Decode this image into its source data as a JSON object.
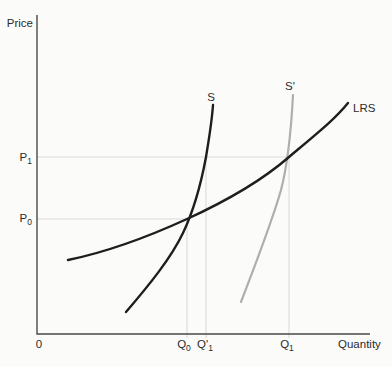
{
  "figure": {
    "axis": {
      "y_label": "Price",
      "x_label": "Quantity",
      "origin": "0"
    },
    "labels": {
      "p1": {
        "base": "P",
        "sub": "1"
      },
      "p0": {
        "base": "P",
        "sub": "0"
      },
      "q0": {
        "base": "Q",
        "sub": "0"
      },
      "q1_prime": {
        "base": "Q",
        "prime": "'",
        "sub": "1"
      },
      "q1": {
        "base": "Q",
        "sub": "1"
      },
      "s": {
        "base": "S"
      },
      "s_prime": {
        "base": "S",
        "prime": "'"
      },
      "lrs": {
        "base": "LRS"
      }
    },
    "colors": {
      "black_curve": "#1e1e1e",
      "gray_curve": "#aeaeae",
      "guide": "#d9d9d9",
      "axis": "#4a4a4a",
      "text": "#2b2b2b",
      "background": "#fbfbfa"
    },
    "paths": {
      "axes": "M37,15 L37,334 L370,334",
      "guide_p1": "M37,157 H289",
      "guide_p0": "M37,219 H187",
      "guide_q0": "M187,219 V338",
      "guide_q1_prime": "M206,157 V338",
      "guide_q1": "M289,157 V338",
      "s": "M126,312 C150,284 171,258 183,233 C193,212 201,184 206,157 C210,133 212,120 213,105",
      "s_prime": "M241,302 C257,260 272,222 281,190 C287,167 291,133 293,95",
      "lrs": "M68,260 C112,251 152,235 187,219 C222,203 258,184 289,157 C320,131 335,119 348,103"
    }
  },
  "chart_data": {
    "type": "line",
    "xlabel": "Quantity",
    "ylabel": "Price",
    "x_tick_labels": [
      "0",
      "Q₀",
      "Q′₁",
      "Q₁"
    ],
    "y_tick_labels": [
      "P₀",
      "P₁"
    ],
    "grid": false,
    "legend_position": "none",
    "series": [
      {
        "name": "S",
        "color": "#1e1e1e",
        "points_px": [
          [
            126,
            312
          ],
          [
            145,
            288
          ],
          [
            162,
            268
          ],
          [
            178,
            250
          ],
          [
            187,
            219
          ],
          [
            198,
            195
          ],
          [
            206,
            157
          ],
          [
            210,
            130
          ],
          [
            213,
            105
          ]
        ]
      },
      {
        "name": "S′",
        "color": "#aeaeae",
        "points_px": [
          [
            241,
            302
          ],
          [
            254,
            267
          ],
          [
            266,
            234
          ],
          [
            274,
            212
          ],
          [
            281,
            188
          ],
          [
            289,
            157
          ],
          [
            291,
            130
          ],
          [
            293,
            95
          ]
        ]
      },
      {
        "name": "LRS",
        "color": "#1e1e1e",
        "points_px": [
          [
            68,
            260
          ],
          [
            110,
            248
          ],
          [
            140,
            244
          ],
          [
            187,
            219
          ],
          [
            240,
            192
          ],
          [
            270,
            175
          ],
          [
            289,
            157
          ],
          [
            317,
            138
          ],
          [
            348,
            103
          ]
        ]
      }
    ],
    "landmarks": [
      {
        "price": "P₀",
        "quantity": "Q₀",
        "on_curves": [
          "S",
          "LRS"
        ],
        "px": [
          187,
          219
        ]
      },
      {
        "price": "P₁",
        "quantity": "Q′₁",
        "on_curves": [
          "S"
        ],
        "px": [
          206,
          157
        ]
      },
      {
        "price": "P₁",
        "quantity": "Q₁",
        "on_curves": [
          "S′",
          "LRS"
        ],
        "px": [
          289,
          157
        ]
      }
    ]
  }
}
